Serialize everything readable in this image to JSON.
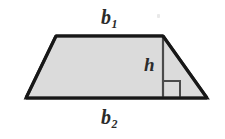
{
  "figure": {
    "name": "trapezoid-area-diagram",
    "shape": "trapezoid",
    "fill_color": "#dcdcdc",
    "outline_color": "#1a1a1a",
    "height_line_color": "#4a4a4a",
    "background_color": "#ffffff",
    "labels": {
      "top_base": {
        "base": "b",
        "subscript": "1",
        "full": "b1"
      },
      "bottom_base": {
        "base": "b",
        "subscript": "2",
        "full": "b2"
      },
      "height": {
        "base": "h",
        "subscript": "",
        "full": "h"
      }
    },
    "geometry": {
      "top_left": [
        56,
        36
      ],
      "top_right": [
        163,
        36
      ],
      "bottom_right": [
        207,
        98
      ],
      "bottom_left": [
        26,
        98
      ],
      "height_segment": [
        [
          163,
          36
        ],
        [
          163,
          98
        ]
      ],
      "right_angle_marker": {
        "x": 163,
        "y": 81,
        "size": 17
      }
    }
  }
}
